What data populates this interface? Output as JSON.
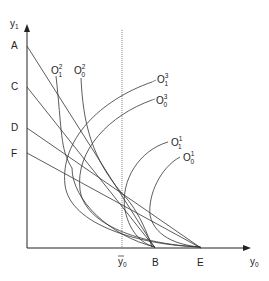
{
  "diagram": {
    "axes": {
      "y_label": "y",
      "y_sub": "1",
      "x_label": "y",
      "x_sub": "0",
      "ybar_label": "y",
      "ybar_sub": "0"
    },
    "y_axis_points": [
      "A",
      "C",
      "D",
      "F"
    ],
    "x_axis_points": [
      "B",
      "E"
    ],
    "curves": [
      {
        "base": "O",
        "sup": "2",
        "sub": "1"
      },
      {
        "base": "O",
        "sup": "2",
        "sub": "0"
      },
      {
        "base": "O",
        "sup": "3",
        "sub": "1"
      },
      {
        "base": "O",
        "sup": "3",
        "sub": "0"
      },
      {
        "base": "O",
        "sup": "1",
        "sub": "1"
      },
      {
        "base": "O",
        "sup": "1",
        "sub": "0"
      }
    ],
    "lines": [
      {
        "from": "A",
        "to": "B"
      },
      {
        "from": "C",
        "to": "B"
      },
      {
        "from": "D",
        "to": "E"
      },
      {
        "from": "F",
        "to": "E"
      }
    ]
  }
}
